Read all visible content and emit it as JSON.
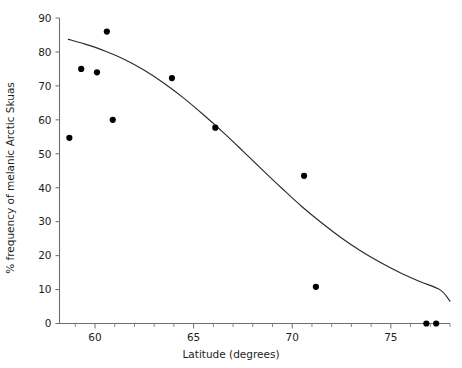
{
  "chart_data": {
    "type": "scatter",
    "title": "",
    "subtitle": "",
    "xlabel": "Latitude (degrees)",
    "ylabel": "% frequency of melanic Arctic Skuas",
    "xlim": [
      58.2,
      78.0
    ],
    "ylim": [
      0,
      90
    ],
    "x_ticks": [
      60,
      65,
      70,
      75
    ],
    "x_tick_labels": [
      "60",
      "65",
      "70",
      "75"
    ],
    "x_minor_tick_step": 1,
    "y_ticks": [
      0,
      10,
      20,
      30,
      40,
      50,
      60,
      70,
      80,
      90
    ],
    "y_tick_labels": [
      "0",
      "10",
      "20",
      "30",
      "40",
      "50",
      "60",
      "70",
      "80",
      "90"
    ],
    "grid": false,
    "legend": false,
    "legend_position": "none",
    "series": [
      {
        "name": "Arctic Skua colonies",
        "type": "scatter",
        "marker": "filled-circle",
        "color": "#000000",
        "points": [
          {
            "x": 58.7,
            "y": 54.7
          },
          {
            "x": 59.3,
            "y": 75.0
          },
          {
            "x": 60.1,
            "y": 74.0
          },
          {
            "x": 60.6,
            "y": 86.0
          },
          {
            "x": 60.9,
            "y": 60.0
          },
          {
            "x": 63.9,
            "y": 72.3
          },
          {
            "x": 66.1,
            "y": 57.7
          },
          {
            "x": 70.6,
            "y": 43.5
          },
          {
            "x": 71.2,
            "y": 10.8
          },
          {
            "x": 76.8,
            "y": 0.0
          },
          {
            "x": 77.3,
            "y": 0.0
          }
        ]
      },
      {
        "name": "Fitted logistic curve",
        "type": "line",
        "color": "#2a2a2a",
        "points": [
          {
            "x": 58.65,
            "y": 83.7
          },
          {
            "x": 59.5,
            "y": 82.3
          },
          {
            "x": 60.5,
            "y": 80.3
          },
          {
            "x": 61.5,
            "y": 77.8
          },
          {
            "x": 62.5,
            "y": 74.6
          },
          {
            "x": 63.5,
            "y": 70.8
          },
          {
            "x": 64.5,
            "y": 66.4
          },
          {
            "x": 65.5,
            "y": 61.5
          },
          {
            "x": 66.5,
            "y": 56.3
          },
          {
            "x": 67.5,
            "y": 50.8
          },
          {
            "x": 68.5,
            "y": 45.2
          },
          {
            "x": 69.5,
            "y": 39.7
          },
          {
            "x": 70.5,
            "y": 34.4
          },
          {
            "x": 71.5,
            "y": 29.6
          },
          {
            "x": 72.5,
            "y": 25.2
          },
          {
            "x": 73.5,
            "y": 21.3
          },
          {
            "x": 74.5,
            "y": 17.9
          },
          {
            "x": 75.5,
            "y": 14.9
          },
          {
            "x": 76.5,
            "y": 12.3
          },
          {
            "x": 77.5,
            "y": 9.9
          },
          {
            "x": 78.0,
            "y": 6.6
          }
        ]
      }
    ],
    "annotations": []
  }
}
